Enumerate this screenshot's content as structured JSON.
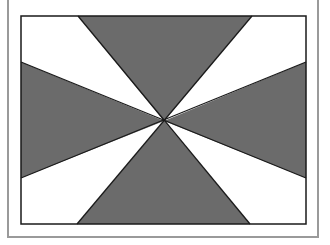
{
  "figure": {
    "colors": {
      "dark": "#6b6b6b",
      "light": "#ffffff",
      "stroke": "#1a1a1a",
      "frame": "#9a9a9a"
    },
    "wedges": [
      {
        "name": "top",
        "fill": "dark"
      },
      {
        "name": "top-right",
        "fill": "light"
      },
      {
        "name": "right",
        "fill": "dark"
      },
      {
        "name": "bottom-right",
        "fill": "light"
      },
      {
        "name": "bottom",
        "fill": "dark"
      },
      {
        "name": "bottom-left",
        "fill": "light"
      },
      {
        "name": "left",
        "fill": "dark"
      },
      {
        "name": "top-left",
        "fill": "light"
      }
    ]
  }
}
